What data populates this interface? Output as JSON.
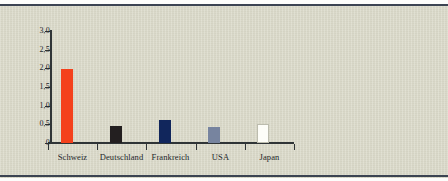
{
  "chart_data": {
    "type": "bar",
    "title": "",
    "subtitle": "",
    "xlabel": "",
    "ylabel": "",
    "categories": [
      "Schweiz",
      "Deutschland",
      "Frankreich",
      "USA",
      "Japan"
    ],
    "values": [
      1.97,
      0.45,
      0.62,
      0.44,
      0.52
    ],
    "series": [
      {
        "name": "",
        "values": [
          1.97,
          0.45,
          0.62,
          0.44,
          0.52
        ]
      }
    ],
    "bar_colors": [
      "#f4411c",
      "#231f20",
      "#11265c",
      "#77849f",
      "#fdfdf8"
    ],
    "ylim": [
      0,
      3.0
    ],
    "ytick_values": [
      0,
      0.5,
      1.0,
      1.5,
      2.0,
      2.5,
      3.0
    ],
    "ytick_labels": [
      "0",
      "0,5",
      "1,0",
      "1,5",
      "2,0",
      "2,5",
      "3,0"
    ],
    "grid": false,
    "legend": false,
    "legend_position": "none",
    "annotations": []
  },
  "figure": {
    "background_color": "#d9d8c7",
    "rule_color": "#3c4452",
    "axis_color": "#2f3436",
    "text_color": "#23272a"
  }
}
